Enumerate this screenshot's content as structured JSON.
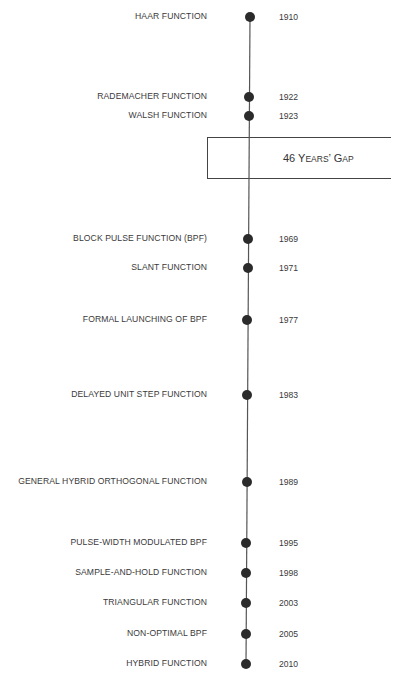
{
  "timeline": {
    "gap_box": {
      "number": "46",
      "word1_initial": "Y",
      "word1_rest": "EARS",
      "apostrophe": "’",
      "word2_initial": "G",
      "word2_rest": "AP",
      "full_text": "46 Years’ Gap"
    },
    "colors": {
      "line": "#555555",
      "dot": "#2b2b2b",
      "text": "#3a3a3a",
      "box_border": "#444444",
      "background": "#ffffff"
    },
    "events": [
      {
        "label": "HAAR FUNCTION",
        "year": "1910",
        "y": 17,
        "x": 250
      },
      {
        "label": "RADEMACHER FUNCTION",
        "year": "1922",
        "y": 97,
        "x": 249
      },
      {
        "label": "WALSH FUNCTION",
        "year": "1923",
        "y": 116,
        "x": 249
      },
      {
        "label": "BLOCK PULSE FUNCTION (BPF)",
        "year": "1969",
        "y": 239,
        "x": 248
      },
      {
        "label": "SLANT FUNCTION",
        "year": "1971",
        "y": 268,
        "x": 248
      },
      {
        "label": "FORMAL LAUNCHING OF BPF",
        "year": "1977",
        "y": 320,
        "x": 247
      },
      {
        "label": "DELAYED UNIT STEP FUNCTION",
        "year": "1983",
        "y": 395,
        "x": 247
      },
      {
        "label": "GENERAL HYBRID ORTHOGONAL FUNCTION",
        "year": "1989",
        "y": 482,
        "x": 247
      },
      {
        "label": "PULSE-WIDTH MODULATED BPF",
        "year": "1995",
        "y": 543,
        "x": 246
      },
      {
        "label": "SAMPLE-AND-HOLD FUNCTION",
        "year": "1998",
        "y": 573,
        "x": 246
      },
      {
        "label": "TRIANGULAR FUNCTION",
        "year": "2003",
        "y": 603,
        "x": 246
      },
      {
        "label": "NON-OPTIMAL BPF",
        "year": "2005",
        "y": 634,
        "x": 246
      },
      {
        "label": "HYBRID FUNCTION",
        "year": "2010",
        "y": 664,
        "x": 246
      }
    ]
  }
}
